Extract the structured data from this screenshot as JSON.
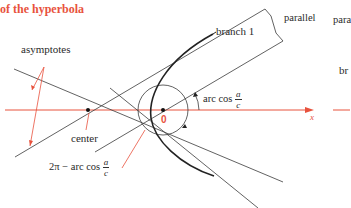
{
  "title": "of the hyperbola",
  "labels": {
    "asymptotes": "asymptotes",
    "parallel_1": "parallel",
    "parallel_2_partial": "para",
    "branch_1": "branch 1",
    "branch_2_partial": "br",
    "center": "center",
    "focus": "0",
    "x_axis": "x",
    "angle_upper_prefix": "arc cos",
    "angle_lower_prefix": "2π − arc cos",
    "frac_num": "a",
    "frac_den": "c"
  },
  "colors": {
    "accent": "#e8523d",
    "line": "#3a3a3a",
    "background": "#ffffff"
  }
}
